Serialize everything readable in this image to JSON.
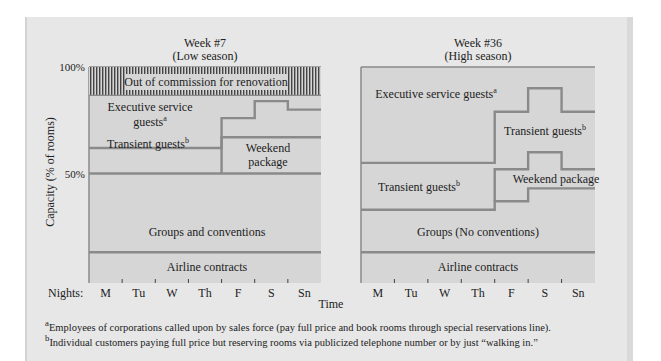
{
  "chart_data": [
    {
      "type": "area",
      "title": "Week #7",
      "subtitle": "(Low season)",
      "ylabel": "Capacity (% of rooms)",
      "xlabel": "Time",
      "x_prefix_label": "Nights:",
      "categories": [
        "M",
        "Tu",
        "W",
        "Th",
        "F",
        "S",
        "Sn"
      ],
      "ylim": [
        0,
        100
      ],
      "yticks": [
        {
          "value": 50,
          "label": "50%"
        },
        {
          "value": 100,
          "label": "100%"
        }
      ],
      "boundaries": [
        {
          "name": "airline-top",
          "values": [
            13,
            13,
            13,
            13,
            13,
            13,
            13
          ]
        },
        {
          "name": "groups-top",
          "values": [
            50,
            50,
            50,
            50,
            50,
            50,
            50
          ]
        },
        {
          "name": "weekend-top",
          "values": [
            null,
            null,
            null,
            null,
            67,
            67,
            67
          ]
        },
        {
          "name": "transient-top",
          "values": [
            62,
            62,
            62,
            62,
            76,
            84,
            80
          ]
        },
        {
          "name": "executive-top",
          "values": [
            87,
            87,
            87,
            87,
            87,
            87,
            87
          ]
        }
      ],
      "bands": [
        {
          "label": "Airline contracts",
          "from": 0,
          "to": 13
        },
        {
          "label": "Groups and conventions",
          "from": 0,
          "to": 50
        },
        {
          "label": "Weekend package",
          "days": [
            "F",
            "S",
            "Sn"
          ]
        },
        {
          "label": "Transient guests",
          "footnote": "b"
        },
        {
          "label": "Executive service guests",
          "footnote": "a"
        },
        {
          "label": "Out of commission for renovation",
          "from": 87,
          "to": 100,
          "pattern": "vertical-hatch"
        }
      ]
    },
    {
      "type": "area",
      "title": "Week #36",
      "subtitle": "(High season)",
      "categories": [
        "M",
        "Tu",
        "W",
        "Th",
        "F",
        "S",
        "Sn"
      ],
      "ylim": [
        0,
        100
      ],
      "boundaries": [
        {
          "name": "airline-top",
          "values": [
            13,
            13,
            13,
            13,
            13,
            13,
            13
          ]
        },
        {
          "name": "groups-top",
          "values": [
            33,
            33,
            33,
            33,
            37,
            43,
            43
          ]
        },
        {
          "name": "weekend-top",
          "values": [
            null,
            null,
            null,
            null,
            52,
            60,
            52
          ]
        },
        {
          "name": "transient-top",
          "values": [
            55,
            55,
            55,
            55,
            79,
            90,
            79
          ]
        }
      ],
      "bands": [
        {
          "label": "Airline contracts"
        },
        {
          "label": "Groups (No conventions)"
        },
        {
          "label": "Weekend package",
          "days": [
            "F",
            "S",
            "Sn"
          ]
        },
        {
          "label": "Transient guests",
          "footnote": "b"
        },
        {
          "label": "Executive service guests",
          "footnote": "a"
        }
      ]
    }
  ],
  "footnotes": [
    {
      "mark": "a",
      "text": "Employees of corporations called upon by sales force (pay full price and book rooms through special reservations line)."
    },
    {
      "mark": "b",
      "text": "Individual customers paying full price but reserving rooms via publicized telephone number or by just “walking in.”"
    }
  ],
  "colors": {
    "panel": "#e7e7e7",
    "plot": "#d6d6d6",
    "line": "#8a8a8a",
    "text": "#222222"
  }
}
